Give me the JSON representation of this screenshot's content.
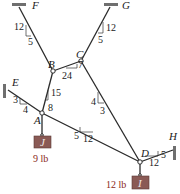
{
  "diagram": {
    "type": "statics cable system",
    "points": {
      "F": {
        "label": "F"
      },
      "G": {
        "label": "G"
      },
      "E": {
        "label": "E"
      },
      "H": {
        "label": "H"
      },
      "A": {
        "label": "A"
      },
      "B": {
        "label": "B"
      },
      "C": {
        "label": "C"
      },
      "D": {
        "label": "D"
      }
    },
    "slopes": {
      "FB": {
        "rise": "12",
        "run": "5"
      },
      "GC": {
        "rise": "12",
        "run": "5"
      },
      "BC": {
        "rise": "7",
        "run": "24"
      },
      "AB": {
        "rise": "15",
        "run": "8"
      },
      "EA": {
        "rise": "3",
        "run": "4"
      },
      "CD": {
        "rise": "4",
        "run": "3"
      },
      "AD": {
        "rise": "5",
        "run": "12"
      },
      "DH": {
        "rise": "5",
        "run": "12"
      }
    },
    "weights": {
      "A": {
        "block_label": "J",
        "value": "9 lb"
      },
      "D": {
        "block_label": "I",
        "value": "12 lb"
      }
    },
    "colors": {
      "line": "#2b2b2b",
      "block": "#8a5a55",
      "weight_text": "#8a2a20",
      "support": "#6f6f6f"
    }
  }
}
